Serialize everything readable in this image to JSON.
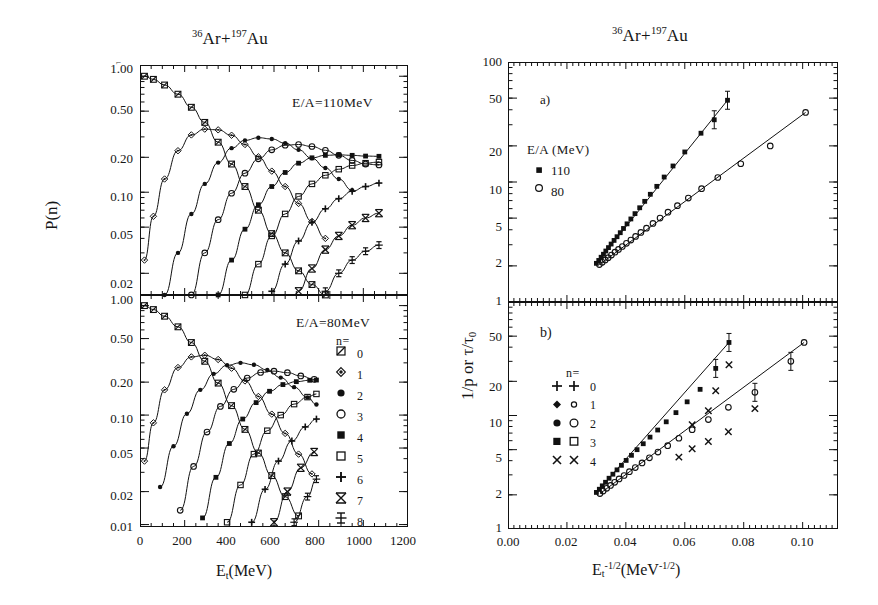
{
  "figure": {
    "background": "#ffffff",
    "ink_color": "#111111"
  },
  "left_group": {
    "title_pre": "",
    "title_sup1": "36",
    "title_mid": "Ar+",
    "title_sup2": "197",
    "title_post": "Au",
    "y_axis_label": "P(n)",
    "x_axis_label_main": "E",
    "x_axis_label_sub": "t",
    "x_axis_label_unit": "(MeV)",
    "x_ticks": [
      "0",
      "200",
      "400",
      "600",
      "800",
      "1000",
      "1200"
    ],
    "x_tick_values": [
      0,
      200,
      400,
      600,
      800,
      1000,
      1200
    ],
    "x_range": [
      0,
      1200
    ],
    "top_panel": {
      "annotation": "E/A=110MeV",
      "y_ticks": [
        "1.00",
        "0.50",
        "0.20",
        "0.10",
        "0.05",
        "0.02"
      ],
      "y_tick_values": [
        1.0,
        0.5,
        0.2,
        0.1,
        0.05,
        0.02
      ],
      "y_range": [
        0.013,
        1.25
      ]
    },
    "bottom_panel": {
      "annotation": "E/A=80MeV",
      "y_ticks": [
        "1.00",
        "0.50",
        "0.20",
        "0.10",
        "0.05",
        "0.02",
        "0.01"
      ],
      "y_tick_values": [
        1.0,
        0.5,
        0.2,
        0.1,
        0.05,
        0.02,
        0.01
      ],
      "y_range": [
        0.0095,
        1.25
      ]
    },
    "legend": {
      "header": "n=",
      "entries": [
        {
          "marker": "open-square-slash",
          "label": "0"
        },
        {
          "marker": "small-open-diamond",
          "label": "1"
        },
        {
          "marker": "filled-circle-small",
          "label": "2"
        },
        {
          "marker": "open-circle",
          "label": "3"
        },
        {
          "marker": "filled-square",
          "label": "4"
        },
        {
          "marker": "open-square",
          "label": "5"
        },
        {
          "marker": "plus",
          "label": "6"
        },
        {
          "marker": "bowtie-x",
          "label": "7"
        },
        {
          "marker": "barred-cross",
          "label": "8"
        }
      ]
    }
  },
  "right_group": {
    "title_sup1": "36",
    "title_mid": "Ar+",
    "title_sup2": "197",
    "title_post": "Au",
    "y_axis_label": "1/p or τ/τ",
    "y_axis_label_sub": "0",
    "x_axis_label_main": "E",
    "x_axis_label_sub": "t",
    "x_axis_label_sup": "-1/2",
    "x_axis_label_unit_open": "(MeV",
    "x_axis_label_unit_sup": "-1/2",
    "x_axis_label_unit_close": ")",
    "x_ticks": [
      "0.00",
      "0.02",
      "0.04",
      "0.06",
      "0.08",
      "0.10"
    ],
    "x_tick_values": [
      0.0,
      0.02,
      0.04,
      0.06,
      0.08,
      0.1
    ],
    "x_range": [
      0.0,
      0.112
    ],
    "top_panel": {
      "panel_label": "a)",
      "y_ticks": [
        "100",
        "50",
        "20",
        "10",
        "5",
        "2",
        "1"
      ],
      "y_tick_values": [
        100,
        50,
        20,
        10,
        5,
        2,
        1
      ],
      "y_range": [
        1,
        100
      ],
      "legend": {
        "header": "E/A (MeV)",
        "entries": [
          {
            "marker": "filled-square",
            "label": "110"
          },
          {
            "marker": "open-circle",
            "label": "80"
          }
        ]
      }
    },
    "bottom_panel": {
      "panel_label": "b)",
      "y_ticks": [
        "100",
        "50",
        "20",
        "10",
        "5",
        "2",
        "1"
      ],
      "y_tick_values": [
        100,
        50,
        20,
        10,
        5,
        2,
        1
      ],
      "y_range": [
        1,
        100
      ],
      "legend": {
        "header": "n=",
        "entries": [
          {
            "marker_a": "plus",
            "marker_b": "plus",
            "label": "0"
          },
          {
            "marker_a": "small-filled-diamond",
            "marker_b": "small-open-circle",
            "label": "1"
          },
          {
            "marker_a": "filled-circle",
            "marker_b": "open-circle",
            "label": "2"
          },
          {
            "marker_a": "filled-square",
            "marker_b": "open-square",
            "label": "3"
          },
          {
            "marker_a": "x-cross",
            "marker_b": "x-cross",
            "label": "4"
          }
        ]
      }
    }
  },
  "chart_data": [
    {
      "type": "line",
      "panel": "top-left",
      "title": "36Ar+197Au",
      "annotation": "E/A=110MeV",
      "xlabel": "E_t (MeV)",
      "ylabel": "P(n)",
      "xlim": [
        0,
        1200
      ],
      "ylim": [
        0.013,
        1.25
      ],
      "yscale": "log",
      "grid": false,
      "legend": "inside-bottom-right-of-lower-panel",
      "series": [
        {
          "name": "n=0",
          "marker": "open-square-slash",
          "x": [
            20,
            60,
            110,
            170,
            230,
            290,
            350,
            410,
            470,
            530,
            590,
            650,
            710,
            770,
            830
          ],
          "y": [
            1.0,
            0.94,
            0.84,
            0.7,
            0.54,
            0.4,
            0.27,
            0.175,
            0.112,
            0.07,
            0.044,
            0.03,
            0.021,
            0.016,
            0.013
          ]
        },
        {
          "name": "n=1",
          "marker": "small-open-diamond",
          "x": [
            20,
            60,
            110,
            170,
            230,
            290,
            350,
            410,
            470,
            530,
            590,
            650,
            710,
            770,
            830
          ],
          "y": [
            0.026,
            0.062,
            0.13,
            0.228,
            0.312,
            0.35,
            0.345,
            0.31,
            0.258,
            0.202,
            0.152,
            0.112,
            0.08,
            0.056,
            0.04
          ]
        },
        {
          "name": "n=2",
          "marker": "filled-circle-small",
          "x": [
            110,
            170,
            230,
            290,
            350,
            410,
            470,
            530,
            590,
            650,
            710,
            770,
            830,
            890,
            950
          ],
          "y": [
            0.013,
            0.03,
            0.065,
            0.118,
            0.18,
            0.24,
            0.28,
            0.295,
            0.288,
            0.265,
            0.232,
            0.196,
            0.162,
            0.13,
            0.104
          ]
        },
        {
          "name": "n=3",
          "marker": "open-circle",
          "x": [
            230,
            290,
            350,
            410,
            470,
            530,
            590,
            650,
            710,
            770,
            830,
            890,
            950,
            1010,
            1070
          ],
          "y": [
            0.013,
            0.03,
            0.058,
            0.098,
            0.146,
            0.194,
            0.232,
            0.254,
            0.258,
            0.248,
            0.23,
            0.208,
            0.188,
            0.175,
            0.172
          ]
        },
        {
          "name": "n=4",
          "marker": "filled-square",
          "x": [
            350,
            410,
            470,
            530,
            590,
            650,
            710,
            770,
            830,
            890,
            950,
            1010,
            1070
          ],
          "y": [
            0.013,
            0.026,
            0.048,
            0.078,
            0.112,
            0.148,
            0.178,
            0.198,
            0.208,
            0.21,
            0.208,
            0.205,
            0.204
          ]
        },
        {
          "name": "n=5",
          "marker": "open-square",
          "x": [
            470,
            530,
            590,
            650,
            710,
            770,
            830,
            890,
            950,
            1010,
            1070
          ],
          "y": [
            0.013,
            0.024,
            0.042,
            0.065,
            0.092,
            0.118,
            0.14,
            0.158,
            0.17,
            0.178,
            0.182
          ]
        },
        {
          "name": "n=6",
          "marker": "plus",
          "x": [
            590,
            650,
            710,
            770,
            830,
            890,
            950,
            1010,
            1070
          ],
          "y": [
            0.014,
            0.024,
            0.038,
            0.055,
            0.072,
            0.088,
            0.102,
            0.112,
            0.12
          ]
        },
        {
          "name": "n=7",
          "marker": "bowtie-x",
          "x": [
            710,
            770,
            830,
            890,
            950,
            1010,
            1070
          ],
          "y": [
            0.014,
            0.022,
            0.032,
            0.042,
            0.052,
            0.06,
            0.066
          ]
        },
        {
          "name": "n=8",
          "marker": "barred-cross",
          "x": [
            830,
            890,
            950,
            1010,
            1070
          ],
          "y": [
            0.014,
            0.02,
            0.026,
            0.031,
            0.035
          ]
        }
      ]
    },
    {
      "type": "line",
      "panel": "bottom-left",
      "annotation": "E/A=80MeV",
      "xlabel": "E_t (MeV)",
      "ylabel": "P(n)",
      "xlim": [
        0,
        1200
      ],
      "ylim": [
        0.0095,
        1.25
      ],
      "yscale": "log",
      "grid": false,
      "series": [
        {
          "name": "n=0",
          "marker": "open-square-slash",
          "x": [
            20,
            60,
            110,
            170,
            230,
            290,
            350,
            410,
            470,
            530,
            590,
            650,
            710
          ],
          "y": [
            1.0,
            0.92,
            0.8,
            0.64,
            0.46,
            0.31,
            0.196,
            0.122,
            0.074,
            0.045,
            0.028,
            0.018,
            0.012
          ]
        },
        {
          "name": "n=1",
          "marker": "small-open-diamond",
          "x": [
            20,
            60,
            110,
            170,
            230,
            290,
            350,
            410,
            470,
            530,
            590,
            650,
            710,
            770
          ],
          "y": [
            0.038,
            0.085,
            0.17,
            0.272,
            0.34,
            0.352,
            0.322,
            0.268,
            0.205,
            0.148,
            0.102,
            0.068,
            0.044,
            0.029
          ]
        },
        {
          "name": "n=2",
          "marker": "filled-circle-small",
          "x": [
            90,
            150,
            210,
            270,
            330,
            390,
            450,
            510,
            570,
            630,
            690,
            750,
            790
          ],
          "y": [
            0.022,
            0.052,
            0.103,
            0.17,
            0.238,
            0.285,
            0.3,
            0.288,
            0.258,
            0.22,
            0.18,
            0.145,
            0.125
          ]
        },
        {
          "name": "n=3",
          "marker": "open-circle",
          "x": [
            180,
            240,
            300,
            360,
            420,
            480,
            540,
            600,
            660,
            720,
            780
          ],
          "y": [
            0.0135,
            0.034,
            0.07,
            0.12,
            0.172,
            0.218,
            0.245,
            0.252,
            0.244,
            0.228,
            0.212
          ]
        },
        {
          "name": "n=4",
          "marker": "filled-square",
          "x": [
            280,
            340,
            400,
            460,
            520,
            580,
            640,
            700,
            760,
            790
          ],
          "y": [
            0.0115,
            0.027,
            0.055,
            0.092,
            0.13,
            0.165,
            0.19,
            0.202,
            0.208,
            0.209
          ]
        },
        {
          "name": "n=5",
          "marker": "open-square",
          "x": [
            390,
            450,
            510,
            570,
            630,
            690,
            750,
            790
          ],
          "y": [
            0.0105,
            0.023,
            0.044,
            0.072,
            0.1,
            0.126,
            0.146,
            0.156
          ]
        },
        {
          "name": "n=6",
          "marker": "plus",
          "x": [
            500,
            560,
            620,
            680,
            740,
            790
          ],
          "y": [
            0.0105,
            0.021,
            0.038,
            0.058,
            0.078,
            0.092
          ]
        },
        {
          "name": "n=7",
          "marker": "bowtie-x",
          "x": [
            600,
            660,
            720,
            780
          ],
          "y": [
            0.0105,
            0.02,
            0.033,
            0.046
          ]
        },
        {
          "name": "n=8",
          "marker": "barred-cross",
          "x": [
            690,
            750,
            790
          ],
          "y": [
            0.0105,
            0.018,
            0.026
          ]
        }
      ]
    },
    {
      "type": "scatter",
      "panel": "top-right",
      "title": "36Ar+197Au",
      "panel_label": "a)",
      "xlabel": "E_t^-1/2 (MeV^-1/2)",
      "ylabel": "1/p or tau/tau_0",
      "xlim": [
        0.0,
        0.112
      ],
      "ylim": [
        1,
        100
      ],
      "yscale": "log",
      "grid": false,
      "series": [
        {
          "name": "110",
          "marker": "filled-square",
          "fit_line": true,
          "x": [
            0.03,
            0.0308,
            0.0316,
            0.0324,
            0.0332,
            0.0341,
            0.035,
            0.036,
            0.037,
            0.0381,
            0.0392,
            0.0404,
            0.0417,
            0.0431,
            0.0447,
            0.0464,
            0.0483,
            0.0505,
            0.053,
            0.056,
            0.06,
            0.0655,
            0.07,
            0.0745
          ],
          "y": [
            2.1,
            2.22,
            2.36,
            2.5,
            2.66,
            2.84,
            3.04,
            3.26,
            3.5,
            3.78,
            4.1,
            4.48,
            4.92,
            5.45,
            6.1,
            6.9,
            7.9,
            9.2,
            11.0,
            13.6,
            17.8,
            25.5,
            33.0,
            48.0
          ],
          "errorbars_at": [
            0.07,
            0.0745
          ]
        },
        {
          "name": "80",
          "marker": "open-circle",
          "fit_line": true,
          "x": [
            0.031,
            0.032,
            0.033,
            0.034,
            0.0351,
            0.0363,
            0.0375,
            0.0388,
            0.0402,
            0.0417,
            0.0433,
            0.0451,
            0.047,
            0.0492,
            0.0516,
            0.0543,
            0.0575,
            0.0612,
            0.0657,
            0.0712,
            0.079,
            0.089,
            0.101
          ],
          "y": [
            2.05,
            2.14,
            2.24,
            2.34,
            2.46,
            2.6,
            2.74,
            2.9,
            3.08,
            3.28,
            3.52,
            3.8,
            4.12,
            4.52,
            5.0,
            5.6,
            6.35,
            7.35,
            8.8,
            10.9,
            14.2,
            20.0,
            38.0
          ]
        }
      ]
    },
    {
      "type": "scatter",
      "panel": "bottom-right",
      "panel_label": "b)",
      "xlabel": "E_t^-1/2 (MeV^-1/2)",
      "ylabel": "1/p or tau/tau_0",
      "xlim": [
        0.0,
        0.112
      ],
      "ylim": [
        1,
        100
      ],
      "yscale": "log",
      "grid": false,
      "series": [
        {
          "name": "n branch upper (110 MeV)",
          "marker": "filled-square",
          "fit_line": true,
          "x": [
            0.03,
            0.031,
            0.032,
            0.0331,
            0.0343,
            0.0356,
            0.037,
            0.0385,
            0.0401,
            0.0419,
            0.0438,
            0.0459,
            0.0482,
            0.0508,
            0.0537,
            0.057,
            0.0608,
            0.0652,
            0.0705,
            0.075
          ],
          "y": [
            2.1,
            2.24,
            2.4,
            2.58,
            2.8,
            3.04,
            3.32,
            3.64,
            4.02,
            4.46,
            5.0,
            5.64,
            6.45,
            7.45,
            8.8,
            10.6,
            13.2,
            17.0,
            26.0,
            44.0
          ],
          "errorbars_at": [
            0.0705,
            0.075
          ]
        },
        {
          "name": "n branch lower (80 MeV)",
          "marker": "open-circle",
          "fit_line": true,
          "x": [
            0.0312,
            0.0323,
            0.0335,
            0.0348,
            0.0362,
            0.0377,
            0.0394,
            0.0412,
            0.0432,
            0.0455,
            0.048,
            0.0509,
            0.0542,
            0.058,
            0.0625,
            0.068,
            0.0748,
            0.0838,
            0.096,
            0.1005
          ],
          "y": [
            2.05,
            2.16,
            2.28,
            2.42,
            2.58,
            2.76,
            2.96,
            3.2,
            3.48,
            3.82,
            4.24,
            4.76,
            5.42,
            6.3,
            7.5,
            9.2,
            11.8,
            16.0,
            30.0,
            44.0
          ],
          "errorbars_at": [
            0.0838,
            0.096
          ]
        },
        {
          "name": "x-markers upper",
          "marker": "x-cross",
          "x": [
            0.0625,
            0.068,
            0.0705,
            0.075
          ],
          "y": [
            8.3,
            11.0,
            16.5,
            28.0
          ]
        },
        {
          "name": "x-markers lower",
          "marker": "x-cross",
          "x": [
            0.058,
            0.0625,
            0.068,
            0.0748,
            0.0838
          ],
          "y": [
            4.3,
            5.1,
            5.9,
            7.2,
            11.5
          ]
        }
      ]
    }
  ]
}
